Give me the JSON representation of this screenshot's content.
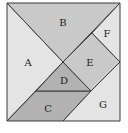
{
  "colors": {
    "light": "#e4e4e4",
    "medium": "#c9c9c9",
    "dark": "#b2b2b2",
    "outline": "#3a3a3a"
  },
  "pieces": [
    {
      "id": "A",
      "label": "A",
      "shape": "large-triangle",
      "shade": "light"
    },
    {
      "id": "B",
      "label": "B",
      "shape": "large-triangle",
      "shade": "medium"
    },
    {
      "id": "C",
      "label": "C",
      "shape": "parallelogram",
      "shade": "dark"
    },
    {
      "id": "D",
      "label": "D",
      "shape": "small-triangle",
      "shade": "dark"
    },
    {
      "id": "E",
      "label": "E",
      "shape": "square",
      "shade": "medium"
    },
    {
      "id": "F",
      "label": "F",
      "shape": "small-triangle",
      "shade": "light"
    },
    {
      "id": "G",
      "label": "G",
      "shape": "medium-triangle",
      "shade": "light"
    }
  ]
}
